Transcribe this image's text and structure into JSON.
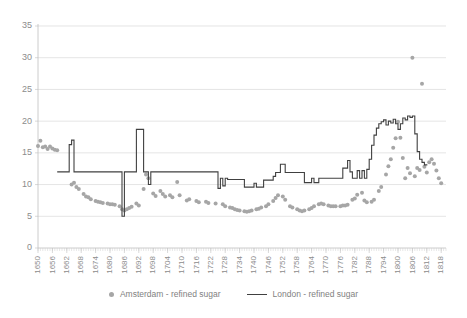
{
  "chart_data": {
    "type": "line",
    "title": "",
    "xlabel": "",
    "ylabel": "",
    "ylim": [
      0,
      35
    ],
    "ytick_step": 5,
    "yticks": [
      "0",
      "5",
      "10",
      "15",
      "20",
      "25",
      "30",
      "35"
    ],
    "xlim": [
      1650,
      1820
    ],
    "xtick_step": 6,
    "xticks": [
      "1650",
      "1656",
      "1662",
      "1668",
      "1674",
      "1680",
      "1686",
      "1692",
      "1698",
      "1704",
      "1710",
      "1716",
      "1722",
      "1728",
      "1734",
      "1740",
      "1746",
      "1752",
      "1758",
      "1764",
      "1770",
      "1776",
      "1782",
      "1788",
      "1794",
      "1800",
      "1806",
      "1812",
      "1818"
    ],
    "grid": "horizontal",
    "legend_position": "bottom",
    "series": [
      {
        "name": "Amsterdam - refined sugar",
        "render": "scatter",
        "color": "#a6a6a6",
        "points": [
          [
            1650,
            16.1
          ],
          [
            1651,
            16.9
          ],
          [
            1652,
            15.9
          ],
          [
            1653,
            16.0
          ],
          [
            1654,
            15.6
          ],
          [
            1655,
            16.0
          ],
          [
            1656,
            15.7
          ],
          [
            1657,
            15.5
          ],
          [
            1658,
            15.4
          ],
          [
            1664,
            10.0
          ],
          [
            1665,
            10.3
          ],
          [
            1666,
            9.6
          ],
          [
            1667,
            9.3
          ],
          [
            1669,
            8.5
          ],
          [
            1670,
            8.1
          ],
          [
            1671,
            8.0
          ],
          [
            1672,
            7.7
          ],
          [
            1674,
            7.4
          ],
          [
            1675,
            7.3
          ],
          [
            1676,
            7.2
          ],
          [
            1677,
            7.1
          ],
          [
            1679,
            7.0
          ],
          [
            1680,
            6.9
          ],
          [
            1681,
            6.9
          ],
          [
            1682,
            6.8
          ],
          [
            1684,
            6.6
          ],
          [
            1685,
            6.1
          ],
          [
            1686,
            5.9
          ],
          [
            1687,
            6.1
          ],
          [
            1688,
            6.3
          ],
          [
            1689,
            6.5
          ],
          [
            1691,
            7.0
          ],
          [
            1692,
            6.7
          ],
          [
            1694,
            9.3
          ],
          [
            1695,
            11.6
          ],
          [
            1696,
            11.0
          ],
          [
            1698,
            8.6
          ],
          [
            1699,
            8.2
          ],
          [
            1701,
            9.0
          ],
          [
            1702,
            8.5
          ],
          [
            1703,
            8.1
          ],
          [
            1705,
            8.3
          ],
          [
            1706,
            8.0
          ],
          [
            1708,
            10.4
          ],
          [
            1709,
            8.3
          ],
          [
            1712,
            7.5
          ],
          [
            1713,
            7.7
          ],
          [
            1716,
            7.4
          ],
          [
            1717,
            7.2
          ],
          [
            1720,
            7.3
          ],
          [
            1721,
            7.1
          ],
          [
            1724,
            7.0
          ],
          [
            1727,
            6.9
          ],
          [
            1728,
            6.6
          ],
          [
            1730,
            6.4
          ],
          [
            1731,
            6.3
          ],
          [
            1732,
            6.1
          ],
          [
            1733,
            6.0
          ],
          [
            1734,
            5.9
          ],
          [
            1736,
            5.8
          ],
          [
            1737,
            5.7
          ],
          [
            1738,
            5.8
          ],
          [
            1739,
            5.9
          ],
          [
            1741,
            6.1
          ],
          [
            1742,
            6.2
          ],
          [
            1743,
            6.4
          ],
          [
            1745,
            6.6
          ],
          [
            1746,
            6.9
          ],
          [
            1748,
            7.4
          ],
          [
            1749,
            7.9
          ],
          [
            1750,
            8.3
          ],
          [
            1752,
            8.1
          ],
          [
            1753,
            7.6
          ],
          [
            1755,
            6.6
          ],
          [
            1756,
            6.4
          ],
          [
            1758,
            6.1
          ],
          [
            1759,
            5.9
          ],
          [
            1760,
            5.8
          ],
          [
            1761,
            5.9
          ],
          [
            1763,
            6.1
          ],
          [
            1764,
            6.3
          ],
          [
            1765,
            6.6
          ],
          [
            1767,
            6.9
          ],
          [
            1768,
            7.0
          ],
          [
            1769,
            6.9
          ],
          [
            1771,
            6.7
          ],
          [
            1772,
            6.6
          ],
          [
            1773,
            6.6
          ],
          [
            1774,
            6.6
          ],
          [
            1776,
            6.6
          ],
          [
            1777,
            6.7
          ],
          [
            1778,
            6.7
          ],
          [
            1779,
            6.8
          ],
          [
            1781,
            7.6
          ],
          [
            1782,
            7.8
          ],
          [
            1783,
            8.4
          ],
          [
            1785,
            8.7
          ],
          [
            1786,
            7.5
          ],
          [
            1787,
            7.2
          ],
          [
            1789,
            7.3
          ],
          [
            1790,
            7.6
          ],
          [
            1792,
            9.0
          ],
          [
            1793,
            9.6
          ],
          [
            1795,
            11.6
          ],
          [
            1796,
            12.9
          ],
          [
            1797,
            14.0
          ],
          [
            1798,
            15.8
          ],
          [
            1799,
            17.3
          ],
          [
            1800,
            19.9
          ],
          [
            1801,
            17.4
          ],
          [
            1802,
            14.2
          ],
          [
            1803,
            11.0
          ],
          [
            1804,
            12.6
          ],
          [
            1805,
            11.8
          ],
          [
            1806,
            30.0
          ],
          [
            1807,
            11.3
          ],
          [
            1808,
            12.6
          ],
          [
            1809,
            12.3
          ],
          [
            1810,
            25.9
          ],
          [
            1811,
            12.8
          ],
          [
            1812,
            11.9
          ],
          [
            1813,
            13.5
          ],
          [
            1814,
            14.0
          ],
          [
            1815,
            13.3
          ],
          [
            1816,
            12.2
          ],
          [
            1817,
            11.0
          ],
          [
            1818,
            10.2
          ]
        ]
      },
      {
        "name": "London - refined sugar",
        "render": "step-line",
        "color": "#404040",
        "points": [
          [
            1658,
            12.0
          ],
          [
            1659,
            12.0
          ],
          [
            1660,
            12.0
          ],
          [
            1661,
            12.0
          ],
          [
            1662,
            12.0
          ],
          [
            1663,
            16.3
          ],
          [
            1664,
            17.0
          ],
          [
            1665,
            12.0
          ],
          [
            1666,
            12.0
          ],
          [
            1667,
            12.0
          ],
          [
            1668,
            12.0
          ],
          [
            1669,
            12.0
          ],
          [
            1670,
            12.0
          ],
          [
            1671,
            12.0
          ],
          [
            1672,
            12.0
          ],
          [
            1673,
            12.0
          ],
          [
            1674,
            12.0
          ],
          [
            1675,
            12.0
          ],
          [
            1676,
            12.0
          ],
          [
            1677,
            12.0
          ],
          [
            1678,
            12.0
          ],
          [
            1679,
            12.0
          ],
          [
            1680,
            12.0
          ],
          [
            1681,
            12.0
          ],
          [
            1682,
            12.0
          ],
          [
            1683,
            12.0
          ],
          [
            1684,
            12.0
          ],
          [
            1685,
            5.0
          ],
          [
            1686,
            12.0
          ],
          [
            1687,
            12.0
          ],
          [
            1688,
            12.0
          ],
          [
            1689,
            12.0
          ],
          [
            1690,
            12.0
          ],
          [
            1691,
            18.7
          ],
          [
            1692,
            18.7
          ],
          [
            1693,
            18.7
          ],
          [
            1694,
            12.0
          ],
          [
            1695,
            12.0
          ],
          [
            1696,
            10.0
          ],
          [
            1697,
            12.0
          ],
          [
            1698,
            12.0
          ],
          [
            1699,
            12.0
          ],
          [
            1700,
            12.0
          ],
          [
            1701,
            12.0
          ],
          [
            1702,
            12.0
          ],
          [
            1703,
            12.0
          ],
          [
            1704,
            12.0
          ],
          [
            1705,
            12.0
          ],
          [
            1706,
            12.0
          ],
          [
            1707,
            12.0
          ],
          [
            1708,
            12.0
          ],
          [
            1709,
            12.0
          ],
          [
            1710,
            12.0
          ],
          [
            1711,
            12.0
          ],
          [
            1712,
            12.0
          ],
          [
            1713,
            12.0
          ],
          [
            1714,
            12.0
          ],
          [
            1715,
            12.0
          ],
          [
            1716,
            12.0
          ],
          [
            1717,
            12.0
          ],
          [
            1718,
            12.0
          ],
          [
            1719,
            12.0
          ],
          [
            1720,
            12.0
          ],
          [
            1721,
            12.0
          ],
          [
            1722,
            12.0
          ],
          [
            1723,
            12.0
          ],
          [
            1724,
            12.0
          ],
          [
            1725,
            9.4
          ],
          [
            1726,
            11.0
          ],
          [
            1727,
            9.8
          ],
          [
            1728,
            11.0
          ],
          [
            1729,
            10.8
          ],
          [
            1730,
            10.8
          ],
          [
            1731,
            10.8
          ],
          [
            1732,
            10.8
          ],
          [
            1733,
            10.8
          ],
          [
            1734,
            10.8
          ],
          [
            1735,
            10.8
          ],
          [
            1736,
            9.6
          ],
          [
            1737,
            9.6
          ],
          [
            1738,
            9.6
          ],
          [
            1739,
            9.6
          ],
          [
            1740,
            10.2
          ],
          [
            1741,
            9.6
          ],
          [
            1742,
            9.6
          ],
          [
            1743,
            9.6
          ],
          [
            1744,
            10.7
          ],
          [
            1745,
            10.7
          ],
          [
            1746,
            10.7
          ],
          [
            1747,
            10.7
          ],
          [
            1748,
            11.3
          ],
          [
            1749,
            11.9
          ],
          [
            1750,
            11.9
          ],
          [
            1751,
            13.2
          ],
          [
            1752,
            13.2
          ],
          [
            1753,
            11.9
          ],
          [
            1754,
            11.9
          ],
          [
            1755,
            11.9
          ],
          [
            1756,
            11.9
          ],
          [
            1757,
            11.9
          ],
          [
            1758,
            11.9
          ],
          [
            1759,
            11.9
          ],
          [
            1760,
            11.9
          ],
          [
            1761,
            10.3
          ],
          [
            1762,
            10.3
          ],
          [
            1763,
            10.3
          ],
          [
            1764,
            11.0
          ],
          [
            1765,
            10.3
          ],
          [
            1766,
            10.3
          ],
          [
            1767,
            11.0
          ],
          [
            1768,
            11.0
          ],
          [
            1769,
            11.0
          ],
          [
            1770,
            11.0
          ],
          [
            1771,
            11.0
          ],
          [
            1772,
            11.0
          ],
          [
            1773,
            11.0
          ],
          [
            1774,
            11.0
          ],
          [
            1775,
            11.0
          ],
          [
            1776,
            11.0
          ],
          [
            1777,
            12.6
          ],
          [
            1778,
            12.6
          ],
          [
            1779,
            13.8
          ],
          [
            1780,
            12.0
          ],
          [
            1781,
            11.0
          ],
          [
            1782,
            11.0
          ],
          [
            1783,
            12.2
          ],
          [
            1784,
            11.0
          ],
          [
            1785,
            12.2
          ],
          [
            1786,
            11.0
          ],
          [
            1787,
            12.4
          ],
          [
            1788,
            14.0
          ],
          [
            1789,
            16.2
          ],
          [
            1790,
            17.8
          ],
          [
            1791,
            18.9
          ],
          [
            1792,
            19.6
          ],
          [
            1793,
            19.9
          ],
          [
            1794,
            20.2
          ],
          [
            1795,
            19.4
          ],
          [
            1796,
            20.0
          ],
          [
            1797,
            19.7
          ],
          [
            1798,
            20.3
          ],
          [
            1799,
            19.6
          ],
          [
            1800,
            18.7
          ],
          [
            1801,
            19.6
          ],
          [
            1802,
            20.5
          ],
          [
            1803,
            20.2
          ],
          [
            1804,
            20.8
          ],
          [
            1805,
            20.6
          ],
          [
            1806,
            20.8
          ],
          [
            1807,
            18.0
          ],
          [
            1808,
            15.2
          ],
          [
            1809,
            14.0
          ],
          [
            1810,
            13.5
          ],
          [
            1811,
            13.1
          ],
          [
            1812,
            13.0
          ]
        ]
      }
    ]
  },
  "legend": {
    "items": [
      {
        "label": "Amsterdam - refined sugar",
        "marker": "dot-marker"
      },
      {
        "label": "London - refined sugar",
        "marker": "line-marker"
      }
    ]
  }
}
